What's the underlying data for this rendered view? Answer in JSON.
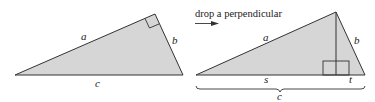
{
  "caption": "drop a perpendicular",
  "colors": {
    "fill": "#d6d6d6",
    "stroke": "#333333"
  },
  "left_triangle": {
    "labels": {
      "a": "a",
      "b": "b",
      "c": "c"
    }
  },
  "right_triangle": {
    "labels": {
      "a": "a",
      "b": "b",
      "s": "s",
      "t": "t",
      "c": "c"
    }
  }
}
